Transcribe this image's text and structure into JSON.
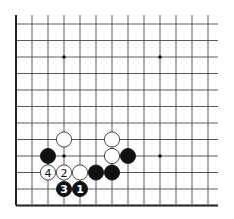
{
  "diagram": {
    "type": "go-board-fragment",
    "board": {
      "columns": 13,
      "rows": 12,
      "origin_x": 16,
      "origin_y": 24,
      "spacing_x": 16,
      "spacing_y": 16.5,
      "right_extension": 10,
      "top_extension": 9,
      "edges": [
        "left",
        "bottom"
      ],
      "line_color": "#4a4a4a",
      "edge_color": "#222222"
    },
    "star_points": [
      {
        "col": 3,
        "row": 2
      },
      {
        "col": 9,
        "row": 2
      },
      {
        "col": 3,
        "row": 8
      },
      {
        "col": 9,
        "row": 8
      }
    ],
    "stones": [
      {
        "color": "white",
        "col": 3,
        "row": 7,
        "label": ""
      },
      {
        "color": "white",
        "col": 6,
        "row": 7,
        "label": ""
      },
      {
        "color": "black",
        "col": 2,
        "row": 8,
        "label": ""
      },
      {
        "color": "white",
        "col": 6,
        "row": 8,
        "label": ""
      },
      {
        "color": "black",
        "col": 7,
        "row": 8,
        "label": ""
      },
      {
        "color": "white",
        "col": 2,
        "row": 9,
        "label": "4"
      },
      {
        "color": "white",
        "col": 3,
        "row": 9,
        "label": "2"
      },
      {
        "color": "white",
        "col": 4,
        "row": 9,
        "label": ""
      },
      {
        "color": "black",
        "col": 5,
        "row": 9,
        "label": ""
      },
      {
        "color": "black",
        "col": 6,
        "row": 9,
        "label": ""
      },
      {
        "color": "black",
        "col": 3,
        "row": 10,
        "label": "3"
      },
      {
        "color": "black",
        "col": 4,
        "row": 10,
        "label": "1"
      }
    ],
    "stone_radius": 8
  }
}
